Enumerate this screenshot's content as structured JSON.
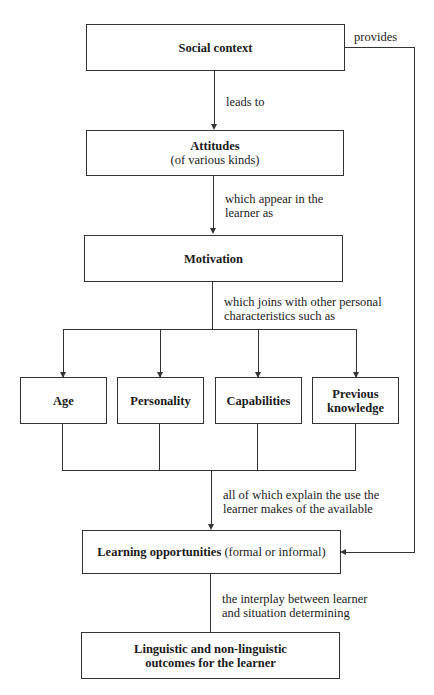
{
  "diagram": {
    "nodes": {
      "social_context": {
        "title": "Social context"
      },
      "attitudes": {
        "title": "Attitudes",
        "subtitle": "(of various kinds)"
      },
      "motivation": {
        "title": "Motivation"
      },
      "age": {
        "title": "Age"
      },
      "personality": {
        "title": "Personality"
      },
      "capabilities": {
        "title": "Capabilities"
      },
      "previous_knowledge": {
        "title_line1": "Previous",
        "title_line2": "knowledge"
      },
      "learning_opportunities": {
        "title": "Learning opportunities",
        "suffix": "(formal or informal)"
      },
      "outcomes": {
        "title_line1": "Linguistic and non-linguistic",
        "title_line2": "outcomes for the learner"
      }
    },
    "edges": {
      "provides": "provides",
      "leads_to": "leads to",
      "appear_line1": "which appear in the",
      "appear_line2": "learner as",
      "joins_line1": "which joins with other personal",
      "joins_line2": "characteristics such as",
      "explain_line1": "all of which explain the use the",
      "explain_line2": "learner makes of the available",
      "interplay_line1": "the interplay between learner",
      "interplay_line2": "and situation determining"
    }
  }
}
